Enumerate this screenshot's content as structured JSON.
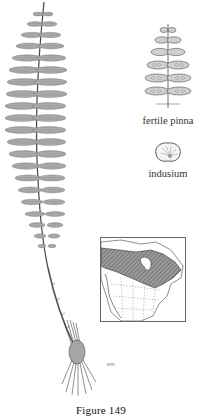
{
  "figure": {
    "caption": "Figure  149",
    "signature": "BRF"
  },
  "labels": {
    "fertile_pinna": "fertile pinna",
    "indusium": "indusium"
  },
  "illustrations": {
    "main": "fern-frond",
    "pinna": "fertile-pinna-detail",
    "indusium": "indusium-detail",
    "map": "range-map-north-america"
  },
  "colors": {
    "ink": "#333333",
    "range_fill": "#8a8a8a",
    "background": "#ffffff"
  }
}
